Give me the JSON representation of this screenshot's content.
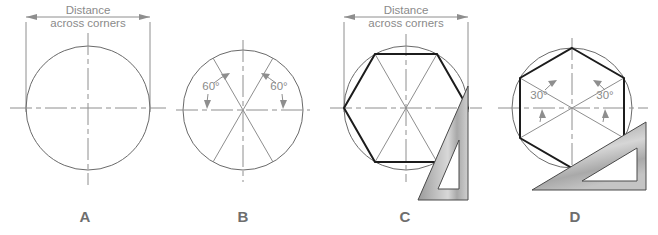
{
  "figure": {
    "title_caption": "",
    "background_color": "#ffffff",
    "line_color": "#8e8e8e",
    "object_line_color": "#1c1c1c",
    "text_color": "#8a8a8a",
    "label_color": "#6e6e6e",
    "tool_fill_color": "#b5b5b5"
  },
  "panels": [
    {
      "id": "A",
      "label": "A",
      "dimension_label_line1": "Distance",
      "dimension_label_line2": "across corners",
      "angle_labels": [],
      "has_circle": true,
      "has_hexagon": false,
      "has_triangle_tool": false,
      "has_dimension": true
    },
    {
      "id": "B",
      "label": "B",
      "dimension_label_line1": "",
      "dimension_label_line2": "",
      "angle_labels": [
        "60°",
        "60°"
      ],
      "has_circle": true,
      "has_hexagon": false,
      "has_triangle_tool": false,
      "has_dimension": false
    },
    {
      "id": "C",
      "label": "C",
      "dimension_label_line1": "Distance",
      "dimension_label_line2": "across corners",
      "angle_labels": [],
      "has_circle": true,
      "has_hexagon": true,
      "has_triangle_tool": true,
      "has_dimension": true
    },
    {
      "id": "D",
      "label": "D",
      "dimension_label_line1": "",
      "dimension_label_line2": "",
      "angle_labels": [
        "30°",
        "30°"
      ],
      "has_circle": true,
      "has_hexagon": true,
      "has_triangle_tool": true,
      "has_dimension": false
    }
  ],
  "geometry": {
    "panel_a": {
      "cx": 88,
      "cy": 108,
      "r": 62
    },
    "panel_b": {
      "cx": 243,
      "cy": 110,
      "r": 60,
      "sector_angle_deg": 60
    },
    "panel_c": {
      "cx": 406,
      "cy": 108,
      "r": 62,
      "hexagon_orientation": "flat-top"
    },
    "panel_d": {
      "cx": 572,
      "cy": 108,
      "r": 60,
      "hexagon_orientation": "pointy-top",
      "tool_angle_deg": 30
    }
  }
}
